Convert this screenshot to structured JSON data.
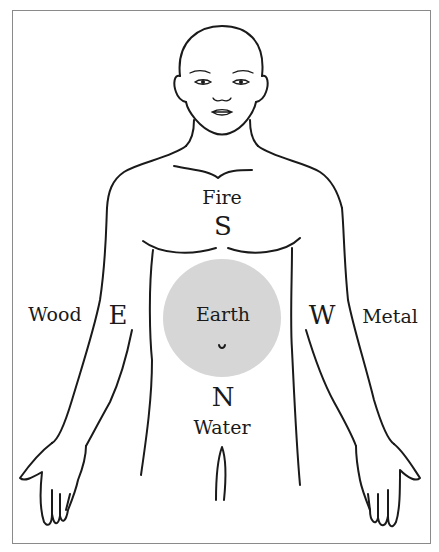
{
  "diagram": {
    "type": "five-elements-body-map",
    "colors": {
      "outline": "#1a1a1a",
      "earth_circle": "#d6d6d6",
      "frame": "#8a8a8a",
      "background": "#ffffff"
    },
    "labels": {
      "fire": "Fire",
      "south": "S",
      "wood": "Wood",
      "east": "E",
      "earth": "Earth",
      "west": "W",
      "metal": "Metal",
      "north": "N",
      "water": "Water"
    }
  }
}
